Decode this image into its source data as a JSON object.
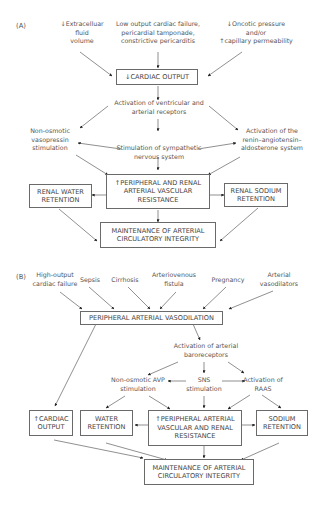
{
  "panelA": {
    "label": "(A)",
    "causes": {
      "ecf": [
        "↓Extracelluar",
        "fluid",
        "volume"
      ],
      "lowOutput": [
        "Low output cardiac failure,",
        "pericardial tamponade,",
        "constrictive pericarditis"
      ],
      "oncotic": [
        "↓Oncotic pressure",
        "and/or",
        "↑capillary permeability"
      ]
    },
    "cardiacOutput": "↓CARDIAC OUTPUT",
    "receptors": [
      "Activation of ventricular and",
      "arterial receptors"
    ],
    "vasopressin": [
      "Non-osmotic",
      "vasopressin",
      "stimulation"
    ],
    "raas": [
      "Activation of the",
      "renin–angiotensin–",
      "aldosterone system"
    ],
    "sympathetic": [
      "Stimulation of sympathetic",
      "nervous system"
    ],
    "resistance": [
      "↑PERIPHERAL AND RENAL",
      "ARTERIAL VASCULAR",
      "RESISTANCE"
    ],
    "water": [
      "RENAL WATER",
      "RETENTION"
    ],
    "sodium": [
      "RENAL SODIUM",
      "RETENTION"
    ],
    "maintenance": [
      "MAINTENANCE OF ARTERIAL",
      "CIRCULATORY INTEGRITY"
    ]
  },
  "panelB": {
    "label": "(B)",
    "causes": {
      "highOutput": [
        "High-output",
        "cardiac failure"
      ],
      "sepsis": [
        "Sepsis"
      ],
      "cirrhosis": [
        "Cirrhosis"
      ],
      "av": [
        "Arteriovenous",
        "fistula"
      ],
      "pregnancy": [
        "Pregnancy"
      ],
      "vasodilators": [
        "Arterial",
        "vasodilators"
      ]
    },
    "vasodilation": "PERIPHERAL ARTERIAL VASODILATION",
    "baroreceptors": [
      "Activation of arterial",
      "baroreceptors"
    ],
    "avp": [
      "Non-osmotic AVP",
      "stimulation"
    ],
    "sns": [
      "SNS",
      "stimulation"
    ],
    "raas": [
      "Activation of",
      "RAAS"
    ],
    "cardiacOutput": [
      "↑CARDIAC",
      "OUTPUT"
    ],
    "water": [
      "WATER",
      "RETENTION"
    ],
    "resistance": [
      "↑PERIPHERAL ARTERIAL",
      "VASCULAR AND RENAL",
      "RESISTANCE"
    ],
    "sodium": [
      "SODIUM",
      "RETENTION"
    ],
    "maintenance": [
      "MAINTENANCE OF ARTERIAL",
      "CIRCULATORY INTEGRITY"
    ]
  },
  "colors": {
    "line": "#3a3a3a",
    "text": "#555555",
    "border": "#6a6a6a"
  }
}
